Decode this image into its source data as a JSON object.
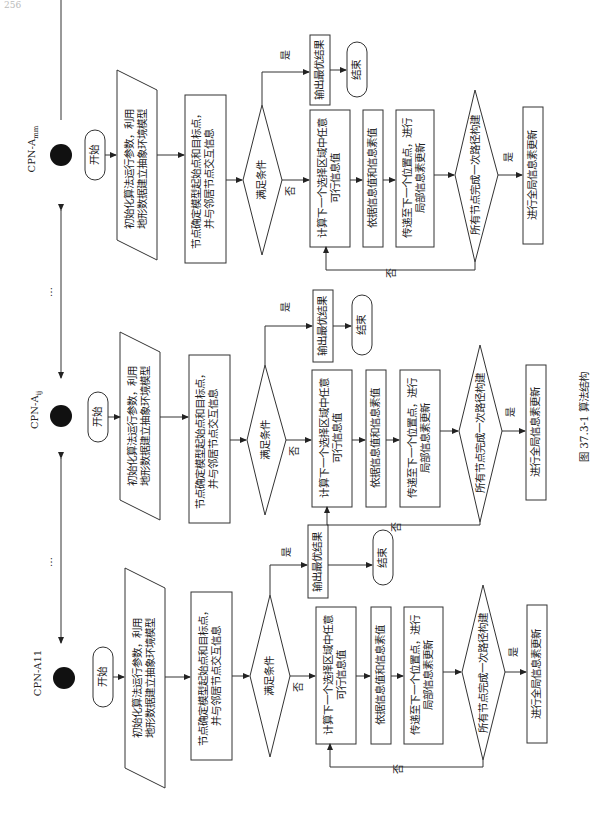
{
  "page": {
    "page_number": "256",
    "caption": "图 37.3-1    算法结构"
  },
  "agents": {
    "top": "CPN-A",
    "top_sub": "mm",
    "middle": "CPN-A",
    "middle_sub": "ij",
    "bottom": "CPN-A11",
    "ellipsis": "…"
  },
  "columns": [
    {
      "id": "top",
      "start": "开始",
      "init_line1": "初始化算法运行参数，利用",
      "init_line2": "地形数据建立抽象环境模型",
      "node_line1": "节点确定模型起始点和目标点，",
      "node_line2": "并与邻居节点交互信息",
      "condition": "满足条件",
      "yes": "是",
      "no": "否",
      "output": "输出最优结果",
      "end": "结束",
      "calc_line1": "计算下一个选择区域中任意",
      "calc_line2": "可行信息值",
      "by_info": "依据信息值和信息素值",
      "move_line1": "传递至下一个位置点，进行",
      "move_line2": "局部信息素更新",
      "all_nodes": "所有节点完成一次路径构建",
      "all_yes": "是",
      "loop_no": "否",
      "global": "进行全局信息素更新"
    },
    {
      "id": "middle",
      "start": "开始",
      "init_line1": "初始化算法运行参数，利用",
      "init_line2": "地形数据建立抽象环境模型",
      "node_line1": "节点确定模型起始点和目标点，",
      "node_line2": "并与邻居节点交互信息",
      "condition": "满足条件",
      "yes": "是",
      "no": "否",
      "output": "输出最优结果",
      "end": "结束",
      "calc_line1": "计算下一个选择区域中任意",
      "calc_line2": "可行信息值",
      "by_info": "依据信息值和信息素值",
      "move_line1": "传递至下一个位置点，进行",
      "move_line2": "局部信息素更新",
      "all_nodes": "所有节点完成一次路径构建",
      "all_yes": "是",
      "loop_no": "否",
      "global": "进行全局信息素更新"
    },
    {
      "id": "bottom",
      "start": "开始",
      "init_line1": "初始化算法运行参数，利用",
      "init_line2": "地形数据建立抽象环境模型",
      "node_line1": "节点确定模型起始点和目标点，",
      "node_line2": "并与邻居节点交互信息",
      "condition": "满足条件",
      "yes": "是",
      "no": "否",
      "output": "输出最优结果",
      "end": "结束",
      "calc_line1": "计算下一个选择区域中任意",
      "calc_line2": "可行信息值",
      "by_info": "依据信息值和信息素值",
      "move_line1": "传递至下一个位置点，进行",
      "move_line2": "局部信息素更新",
      "all_nodes": "所有节点完成一次路径构建",
      "all_yes": "是",
      "loop_no": "否",
      "global": "进行全局信息素更新"
    }
  ]
}
